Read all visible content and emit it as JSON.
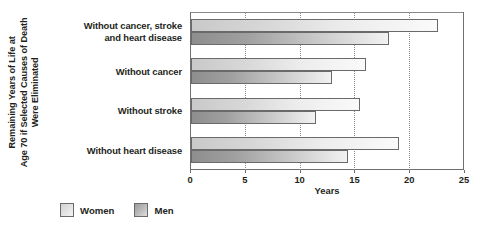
{
  "chart_data": {
    "type": "bar",
    "orientation": "horizontal",
    "title": "",
    "xlabel": "Years",
    "ylabel": "Remaining Years of Life at Age 70 if Selected Causes of Death Were Eliminated",
    "ylabel_lines": [
      "Remaining Years of Life at",
      "Age 70 if Selected Causes of Death",
      "Were Eliminated"
    ],
    "categories": [
      "Without cancer, stroke and heart disease",
      "Without cancer",
      "Without stroke",
      "Without heart disease"
    ],
    "category_lines": [
      [
        "Without cancer, stroke",
        "and heart disease"
      ],
      [
        "Without cancer"
      ],
      [
        "Without stroke"
      ],
      [
        "Without heart disease"
      ]
    ],
    "series": [
      {
        "name": "Women",
        "values": [
          22.5,
          16.0,
          15.4,
          19.0
        ],
        "color": "#e0e0e0"
      },
      {
        "name": "Men",
        "values": [
          18.1,
          12.9,
          11.4,
          14.3
        ],
        "color": "#a8a8a8"
      }
    ],
    "xlim": [
      0,
      25
    ],
    "xticks": [
      0,
      5,
      10,
      15,
      20,
      25
    ],
    "xtick_labels": [
      "0",
      "5",
      "10",
      "15",
      "20",
      "25"
    ],
    "grid": "vertical-dotted",
    "legend": {
      "position": "bottom-left",
      "entries": [
        {
          "label": "Women",
          "swatch": "women-swatch"
        },
        {
          "label": "Men",
          "swatch": "men-swatch"
        }
      ]
    }
  }
}
